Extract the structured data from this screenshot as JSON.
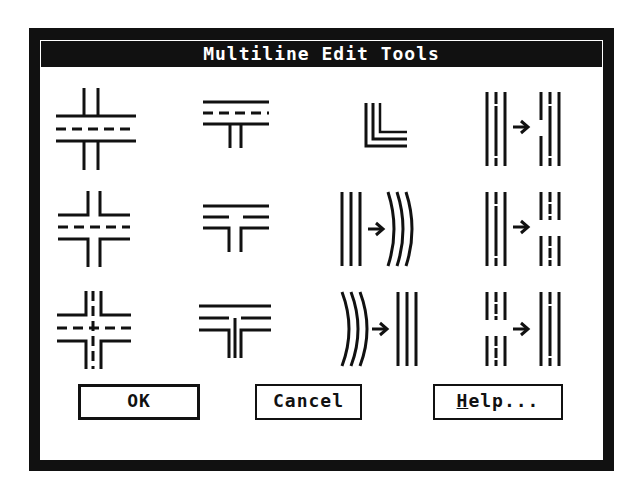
{
  "dialog": {
    "title": "Multiline Edit Tools"
  },
  "tools": [
    {
      "name": "closed-cross",
      "row": 1,
      "col": 1
    },
    {
      "name": "closed-tee",
      "row": 1,
      "col": 2
    },
    {
      "name": "corner-joint",
      "row": 1,
      "col": 3
    },
    {
      "name": "cut-single",
      "row": 1,
      "col": 4
    },
    {
      "name": "open-cross",
      "row": 2,
      "col": 1
    },
    {
      "name": "open-tee",
      "row": 2,
      "col": 2
    },
    {
      "name": "add-vertex",
      "row": 2,
      "col": 3
    },
    {
      "name": "cut-all",
      "row": 2,
      "col": 4
    },
    {
      "name": "merged-cross",
      "row": 3,
      "col": 1
    },
    {
      "name": "merged-tee",
      "row": 3,
      "col": 2
    },
    {
      "name": "delete-vertex",
      "row": 3,
      "col": 3
    },
    {
      "name": "weld-all",
      "row": 3,
      "col": 4
    }
  ],
  "buttons": {
    "ok": "OK",
    "cancel": "Cancel",
    "help_accel": "H",
    "help_rest": "elp..."
  }
}
